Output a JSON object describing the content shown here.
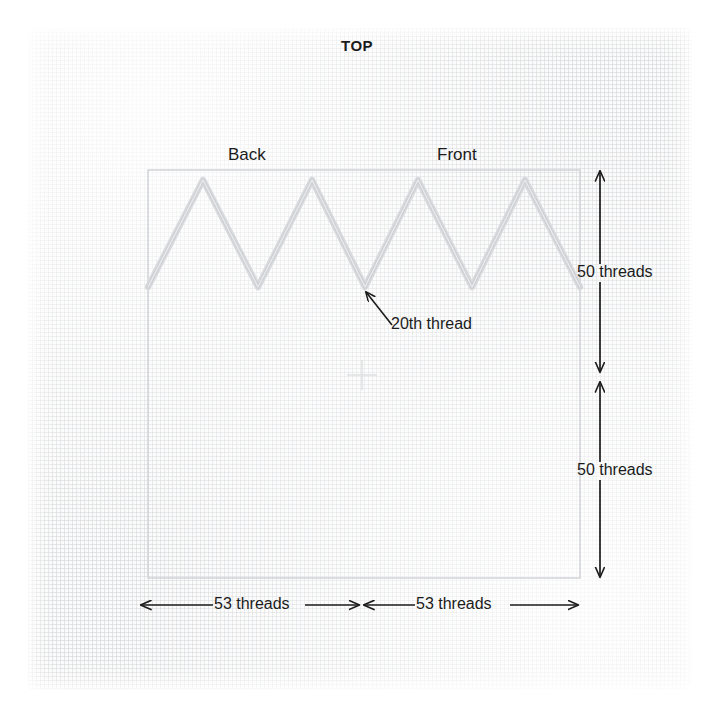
{
  "diagram": {
    "title": "TOP",
    "orientation_labels": {
      "back": "Back",
      "front": "Front"
    },
    "annotations": {
      "thread_callout": "20th thread"
    },
    "dimensions": {
      "vertical_upper": "50 threads",
      "vertical_lower": "50 threads",
      "horizontal_left": "53 threads",
      "horizontal_right": "53 threads"
    },
    "colors": {
      "ink": "#1b1b1b",
      "fabric": "#fbfbfb",
      "stitch": "#d5d7da",
      "outline": "#d0d2d5",
      "grid": "#d0d2d4"
    },
    "geometry": {
      "box": {
        "x": 148,
        "y": 170,
        "width": 432,
        "height": 408
      },
      "zigzag": {
        "peak_y": 180,
        "valley_y": 287,
        "points": "148,287 203,180 258,287 312,180 365,287 418,180 472,287 525,180 580,287"
      },
      "center_mark": {
        "x": 362,
        "y": 375
      },
      "vertical_dim_x": 600,
      "vertical_dim_mid_y": 377,
      "horizontal_dim_y": 605,
      "horizontal_dim_mid_x": 361
    }
  }
}
